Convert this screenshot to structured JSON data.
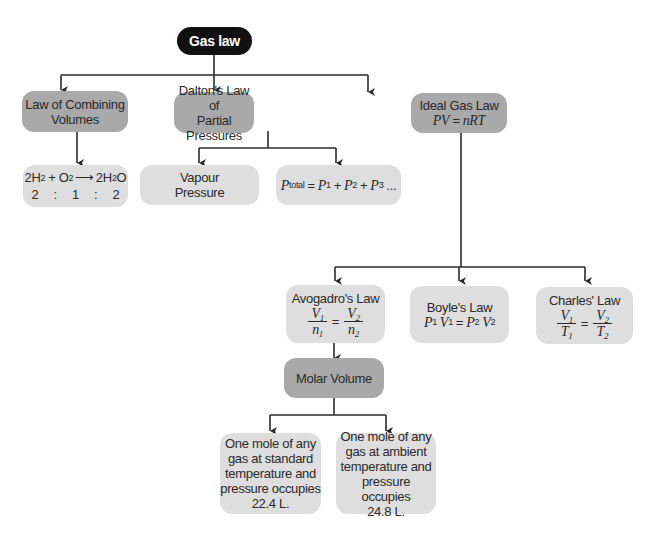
{
  "diagram": {
    "title": "Gas law",
    "nodes": {
      "root": {
        "label": "Gas law"
      },
      "combining": {
        "label": "Law of Combining Volumes",
        "line1": "Law of Combining",
        "line2": "Volumes"
      },
      "dalton": {
        "label": "Dalton's Law of Partial Pressures",
        "line1": "Dalton's Law of",
        "line2": "Partial Pressures"
      },
      "ideal": {
        "label": "Ideal Gas Law",
        "equation": "PV = nRT",
        "eq_lhs": "PV",
        "eq_op": "=",
        "eq_rhs": "nRT"
      },
      "reaction": {
        "equation": "2H2 + O2 → 2H2O",
        "r1_coef": "2H",
        "r1_sub": "2",
        "plus": "+",
        "r2": "O",
        "r2_sub": "2",
        "arrow": "⟶",
        "p_coef": "2H",
        "p_sub": "2",
        "p_end": "O",
        "ratio": [
          "2",
          ":",
          "1",
          ":",
          "2"
        ]
      },
      "vapour": {
        "label": "Vapour Pressure",
        "line1": "Vapour",
        "line2": "Pressure"
      },
      "ptotal": {
        "equation": "Ptotal = P1 + P2 + P3 ...",
        "P": "P",
        "total": "total",
        "eq": "=",
        "plus": "+",
        "dots": "...",
        "subs": [
          "1",
          "2",
          "3"
        ]
      },
      "avogadro": {
        "label": "Avogadro's Law",
        "equation": "V1/n1 = V2/n2",
        "num": "V",
        "den": "n",
        "subs": [
          "1",
          "2"
        ],
        "eq": "="
      },
      "boyle": {
        "label": "Boyle's Law",
        "equation": "P1 V1 = P2 V2",
        "P": "P",
        "V": "V",
        "subs": [
          "1",
          "2"
        ],
        "eq": "="
      },
      "charles": {
        "label": "Charles' Law",
        "equation": "V1/T1 = V2/T2",
        "num": "V",
        "den": "T",
        "subs": [
          "1",
          "2"
        ],
        "eq": "="
      },
      "molar": {
        "label": "Molar Volume"
      },
      "stp": {
        "lines": [
          "One mole of any",
          "gas at standard",
          "temperature and",
          "pressure occupies",
          "22.4 L."
        ]
      },
      "ambient": {
        "lines": [
          "One mole of any",
          "gas at ambient",
          "temperature and",
          "pressure occupies",
          "24.8 L."
        ]
      }
    },
    "edges": [
      [
        "root",
        "combining"
      ],
      [
        "root",
        "dalton"
      ],
      [
        "root",
        "ideal"
      ],
      [
        "combining",
        "reaction"
      ],
      [
        "dalton",
        "vapour"
      ],
      [
        "dalton",
        "ptotal"
      ],
      [
        "ideal",
        "avogadro"
      ],
      [
        "ideal",
        "boyle"
      ],
      [
        "ideal",
        "charles"
      ],
      [
        "avogadro",
        "molar"
      ],
      [
        "molar",
        "stp"
      ],
      [
        "molar",
        "ambient"
      ]
    ],
    "colors": {
      "root": "#111111",
      "primary": "#a9a9a9",
      "secondary": "#dedede",
      "line": "#2a2a2a"
    }
  }
}
